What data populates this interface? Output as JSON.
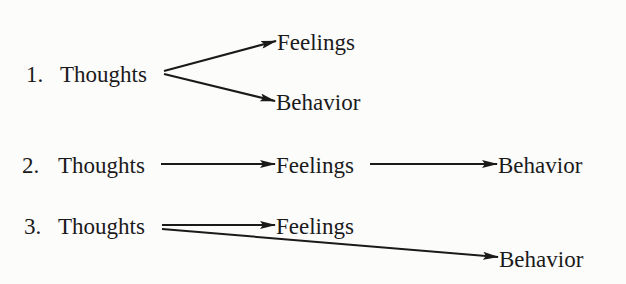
{
  "diagram": {
    "type": "flow-models",
    "colors": {
      "ink": "#1a1a1a",
      "background": "#fcfcfa"
    },
    "models": [
      {
        "number": "1.",
        "source": "Thoughts",
        "targets": [
          "Feelings",
          "Behavior"
        ],
        "description": "Thoughts lead separately to Feelings and to Behavior"
      },
      {
        "number": "2.",
        "source": "Thoughts",
        "chain": [
          "Thoughts",
          "Feelings",
          "Behavior"
        ],
        "description": "Thoughts lead to Feelings, which lead to Behavior"
      },
      {
        "number": "3.",
        "source": "Thoughts",
        "targets": [
          "Feelings",
          "Behavior"
        ],
        "description": "Thoughts lead to Feelings and directly to Behavior"
      }
    ]
  },
  "labels": {
    "row1": {
      "num": "1.",
      "source": "Thoughts",
      "upper": "Feelings",
      "lower": "Behavior"
    },
    "row2": {
      "num": "2.",
      "source": "Thoughts",
      "middle": "Feelings",
      "end": "Behavior"
    },
    "row3": {
      "num": "3.",
      "source": "Thoughts",
      "upper": "Feelings",
      "lower": "Behavior"
    }
  }
}
